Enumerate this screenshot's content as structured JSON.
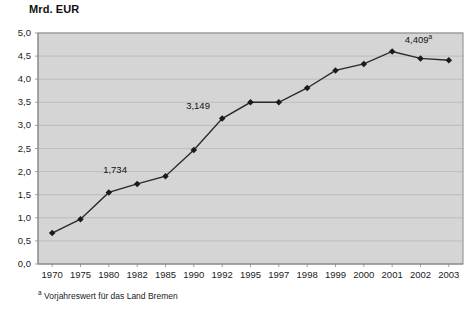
{
  "chart_data": {
    "type": "line",
    "title": "Mrd. EUR",
    "xlabel": "",
    "ylabel": "Mrd. EUR",
    "ylim": [
      0,
      5
    ],
    "ytick_step": 0.5,
    "grid": true,
    "legend": null,
    "categories": [
      "1970",
      "1975",
      "1980",
      "1982",
      "1985",
      "1990",
      "1992",
      "1995",
      "1997",
      "1998",
      "1999",
      "2000",
      "2001",
      "2002",
      "2003"
    ],
    "values": [
      0.67,
      0.97,
      1.55,
      1.734,
      1.9,
      2.47,
      3.149,
      3.5,
      3.5,
      3.81,
      4.19,
      4.33,
      4.6,
      4.45,
      4.409
    ],
    "ytick_labels": [
      "0,0",
      "0,5",
      "1,0",
      "1,5",
      "2,0",
      "2,5",
      "3,0",
      "3,5",
      "4,0",
      "4,5",
      "5,0"
    ],
    "ytick_values": [
      0,
      0.5,
      1,
      1.5,
      2,
      2.5,
      3,
      3.5,
      4,
      4.5,
      5
    ],
    "annotations": [
      {
        "category": "1982",
        "text": "1,734",
        "value": 1.734
      },
      {
        "category": "1992",
        "text": "3,149",
        "value": 3.149
      },
      {
        "category": "2003",
        "text": "4,409",
        "superscript": "a",
        "value": 4.409
      }
    ],
    "colors": {
      "plot_background": "#d5d5d5",
      "line": "#2a2a2a",
      "marker": "#1a1a1a",
      "grid": "#b6b6b6",
      "axis": "#8a8a8a",
      "text": "#1a1a1a"
    }
  },
  "footnote": {
    "mark": "a",
    "text": " Vorjahreswert für das Land Bremen"
  }
}
